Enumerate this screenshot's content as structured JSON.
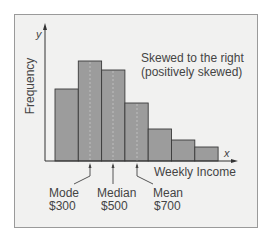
{
  "figure": {
    "annotation_line1": "Skewed to the right",
    "annotation_line2": "(positively skewed)",
    "y_axis_letter": "y",
    "x_axis_letter": "x",
    "y_axis_label": "Frequency",
    "x_axis_label": "Weekly Income",
    "markers": [
      {
        "name": "Mode",
        "value": "$300"
      },
      {
        "name": "Median",
        "value": "$500"
      },
      {
        "name": "Mean",
        "value": "$700"
      }
    ]
  },
  "colors": {
    "background": "#f1f1f0",
    "bar_fill": "#9c9c9c",
    "bar_edge": "#3a3a3a",
    "axis": "#333333",
    "text": "#444444"
  },
  "chart_data": {
    "type": "bar",
    "title": "Skewed to the right (positively skewed)",
    "xlabel": "Weekly Income",
    "ylabel": "Frequency",
    "categories": [
      "bin1",
      "bin2",
      "bin3",
      "bin4",
      "bin5",
      "bin6",
      "bin7"
    ],
    "values": [
      72,
      100,
      91,
      58,
      32,
      21,
      14
    ],
    "grid": false,
    "annotations": [
      {
        "label": "Mode",
        "value": "$300"
      },
      {
        "label": "Median",
        "value": "$500"
      },
      {
        "label": "Mean",
        "value": "$700"
      }
    ]
  }
}
